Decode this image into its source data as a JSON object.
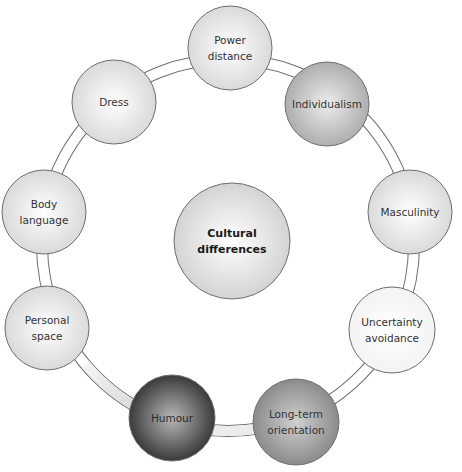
{
  "diagram": {
    "center": {
      "lines": [
        "Cultural",
        "differences"
      ],
      "cx": 232,
      "cy": 241,
      "r": 58,
      "fill": "#e8e8e8",
      "bold": true
    },
    "ring": {
      "cx": 228,
      "cy": 245,
      "r": 186,
      "band_width": 10
    },
    "nodes": [
      {
        "id": "power-distance",
        "lines": [
          "Power",
          "distance"
        ],
        "cx": 230,
        "cy": 48,
        "r": 42,
        "fill": "#e4e4e4",
        "shade": "light"
      },
      {
        "id": "individualism",
        "lines": [
          "Individualism"
        ],
        "cx": 327,
        "cy": 104,
        "r": 42,
        "fill": "#c4c4c4",
        "shade": "mid-light"
      },
      {
        "id": "masculinity",
        "lines": [
          "Masculinity"
        ],
        "cx": 410,
        "cy": 212,
        "r": 42,
        "fill": "#eaeaea",
        "shade": "light"
      },
      {
        "id": "uncertainty-avoidance",
        "lines": [
          "Uncertainty",
          "avoidance"
        ],
        "cx": 392,
        "cy": 330,
        "r": 43,
        "fill": "#fafafa",
        "shade": "white"
      },
      {
        "id": "long-term-orientation",
        "lines": [
          "Long-term",
          "orientation"
        ],
        "cx": 296,
        "cy": 422,
        "r": 43,
        "fill": "#9a9a9a",
        "shade": "mid"
      },
      {
        "id": "humour",
        "lines": [
          "Humour"
        ],
        "cx": 172,
        "cy": 418,
        "r": 43,
        "fill": "#555555",
        "shade": "dark"
      },
      {
        "id": "personal-space",
        "lines": [
          "Personal",
          "space"
        ],
        "cx": 47,
        "cy": 328,
        "r": 42,
        "fill": "#f0f0f0",
        "shade": "light"
      },
      {
        "id": "body-language",
        "lines": [
          "Body",
          "language"
        ],
        "cx": 44,
        "cy": 212,
        "r": 42,
        "fill": "#eeeeee",
        "shade": "light"
      },
      {
        "id": "dress",
        "lines": [
          "Dress"
        ],
        "cx": 114,
        "cy": 102,
        "r": 42,
        "fill": "#e6e6e6",
        "shade": "light"
      }
    ],
    "colors": {
      "stroke": "#6e6e6e",
      "ring_fill": "#ffffff",
      "ring_shaded_fill": "#d8d8d8"
    }
  }
}
